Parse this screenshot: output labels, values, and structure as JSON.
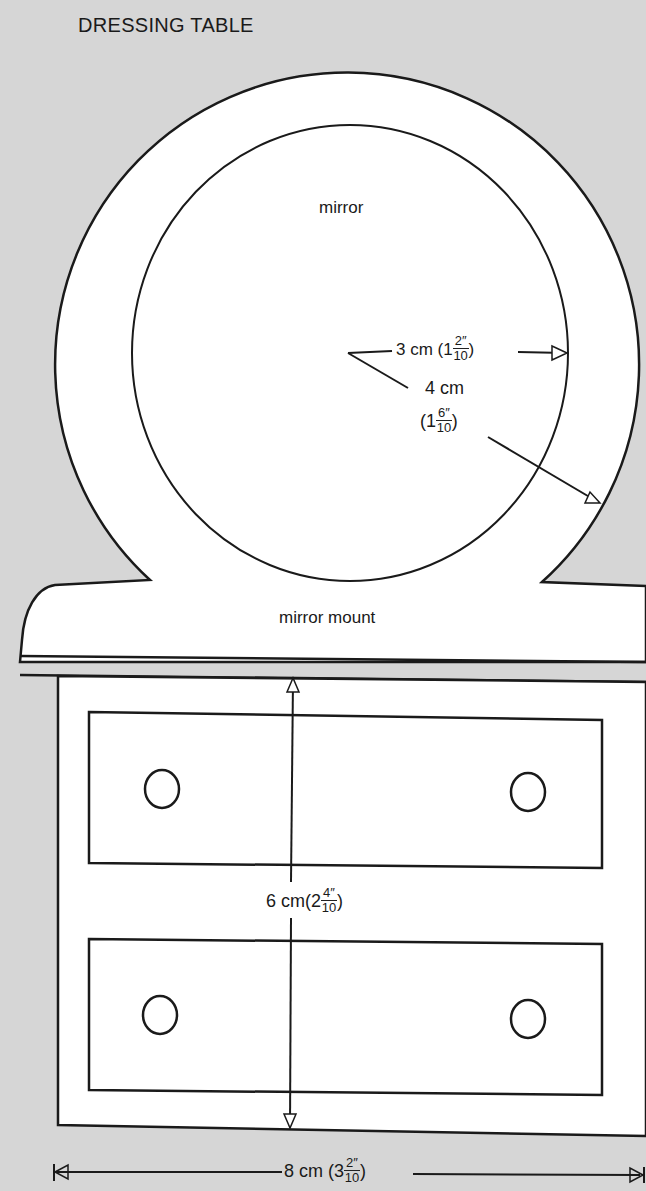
{
  "title": "DRESSING TABLE",
  "labels": {
    "mirror": "mirror",
    "mirror_mount": "mirror mount"
  },
  "dimensions": {
    "mirror_radius": {
      "metric": "3 cm",
      "whole": "1",
      "num": "2",
      "den": "10",
      "unit": "″"
    },
    "frame_radius": {
      "metric": "4 cm",
      "whole": "1",
      "num": "6",
      "den": "10",
      "unit": "″"
    },
    "height": {
      "metric": "6 cm",
      "whole": "2",
      "num": "4",
      "den": "10",
      "unit": "″"
    },
    "width": {
      "metric": "8 cm",
      "whole": "3",
      "num": "2",
      "den": "10",
      "unit": "″"
    }
  },
  "colors": {
    "background": "#d6d6d6",
    "paper": "#ffffff",
    "ink": "#1a1a1a"
  }
}
